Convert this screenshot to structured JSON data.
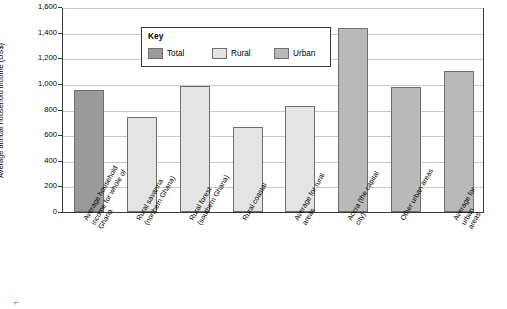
{
  "chart_data": {
    "type": "bar",
    "title": "",
    "xlabel": "",
    "ylabel": "Average annual household income (US$)",
    "ylim": [
      0,
      1600
    ],
    "yticks": [
      0,
      200,
      400,
      600,
      800,
      1000,
      1200,
      1400,
      1600
    ],
    "ytick_labels": [
      "0",
      "200",
      "400",
      "600",
      "800",
      "1,000",
      "1,200",
      "1,400",
      "1,600"
    ],
    "grid": true,
    "legend": {
      "title": "Key",
      "position": "top-left-inside",
      "entries": [
        {
          "name": "Total",
          "color": "#9a9a9a"
        },
        {
          "name": "Rural",
          "color": "#e4e4e4"
        },
        {
          "name": "Urban",
          "color": "#b9b9b9"
        }
      ]
    },
    "categories": [
      "Average household\nincome for whole of\nGhana",
      "Rural savanna\n(northern Ghana)",
      "Rural forest\n(southern Ghana)",
      "Rural coastal",
      "Average for rural\nareas",
      "Accra (the capital\ncity)",
      "Other urban areas",
      "Average for urban\nareas"
    ],
    "values": [
      950,
      740,
      980,
      660,
      830,
      1440,
      975,
      1100
    ],
    "series_of": [
      "Total",
      "Rural",
      "Rural",
      "Rural",
      "Rural",
      "Urban",
      "Urban",
      "Urban"
    ]
  },
  "page_mark": "⌐"
}
